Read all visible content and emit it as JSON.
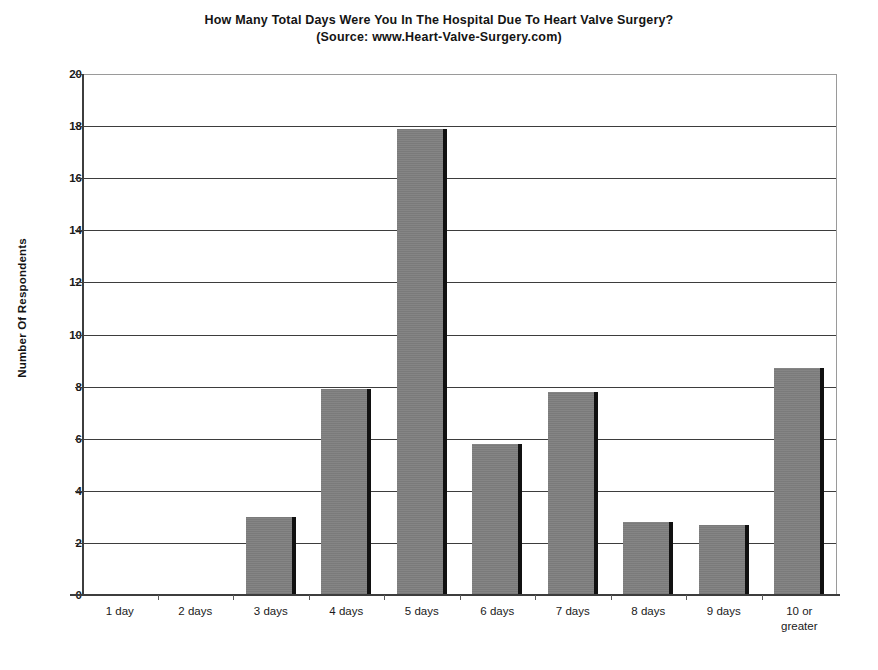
{
  "chart_data": {
    "type": "bar",
    "title": "How Many Total Days Were You In The Hospital Due To Heart Valve Surgery?",
    "subtitle": "(Source: www.Heart-Valve-Surgery.com)",
    "xlabel": "",
    "ylabel": "Number Of Respondents",
    "categories": [
      "1 day",
      "2 days",
      "3 days",
      "4 days",
      "5 days",
      "6 days",
      "7 days",
      "8 days",
      "9 days",
      "10 or greater"
    ],
    "category_lines": [
      [
        "1 day"
      ],
      [
        "2 days"
      ],
      [
        "3 days"
      ],
      [
        "4 days"
      ],
      [
        "5 days"
      ],
      [
        "6 days"
      ],
      [
        "7 days"
      ],
      [
        "8 days"
      ],
      [
        "9 days"
      ],
      [
        "10 or",
        "greater"
      ]
    ],
    "values": [
      0,
      0,
      3.0,
      7.9,
      17.9,
      5.8,
      7.8,
      2.8,
      2.7,
      8.7
    ],
    "ylim": [
      0,
      20
    ],
    "ytick_values": [
      0,
      2,
      4,
      6,
      8,
      10,
      12,
      14,
      16,
      18,
      20
    ],
    "ytick_labels": [
      "0",
      "2",
      "4",
      "6",
      "8",
      "10",
      "12",
      "14",
      "16",
      "18",
      "20"
    ],
    "grid": true,
    "grid_axis": "y",
    "legend": false,
    "bar_color": "#808080",
    "bar_edge_color": "#111111",
    "grid_color": "#3d3d3d",
    "frame_color": "#8c8c8c",
    "text_color": "#1a1a1a"
  }
}
